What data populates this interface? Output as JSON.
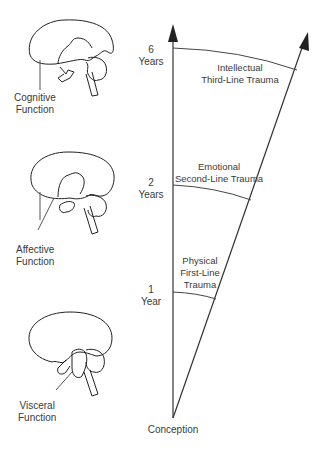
{
  "diagram": {
    "brains": [
      {
        "label_line1": "Cognitive",
        "label_line2": "Function"
      },
      {
        "label_line1": "Affective",
        "label_line2": "Function"
      },
      {
        "label_line1": "Visceral",
        "label_line2": "Function"
      }
    ],
    "axis_markers": [
      {
        "num": "6",
        "unit": "Years"
      },
      {
        "num": "2",
        "unit": "Years"
      },
      {
        "num": "1",
        "unit": "Year"
      }
    ],
    "traumas": [
      {
        "line1": "Intellectual",
        "line2": "Third-Line Trauma"
      },
      {
        "line1": "Emotional",
        "line2": "Second-Line Trauma"
      },
      {
        "line1": "Physical",
        "line2": "First-Line",
        "line3": "Trauma"
      }
    ],
    "origin_label": "Conception",
    "colors": {
      "line": "#333333",
      "text": "#3a3a3a",
      "background": "#ffffff"
    }
  }
}
